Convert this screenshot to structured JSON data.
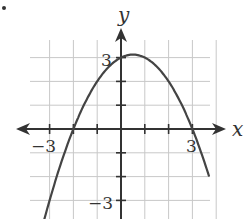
{
  "chart_data": {
    "type": "line",
    "title": "",
    "xlabel": "x",
    "ylabel": "y",
    "xlim": [
      -3.5,
      3.8
    ],
    "ylim": [
      -3.9,
      4.1
    ],
    "grid": true,
    "x_tick_labels": [
      {
        "value": -3,
        "label": "−3"
      },
      {
        "value": 3,
        "label": "3"
      }
    ],
    "y_tick_labels": [
      {
        "value": 3,
        "label": "3"
      },
      {
        "value": -3,
        "label": "−3"
      }
    ],
    "series": [
      {
        "name": "parabola",
        "function": "y = -0.5(x+2)(x-3)",
        "x": [
          -3.25,
          -3,
          -2.5,
          -2,
          -1.5,
          -1,
          -0.5,
          0,
          0.5,
          1,
          1.5,
          2,
          2.5,
          3,
          3.5,
          3.7
        ],
        "y": [
          -3.94,
          -3,
          -1.38,
          0,
          1.31,
          2,
          2.63,
          3,
          3.13,
          3,
          2.63,
          2,
          1.13,
          0,
          -1.38,
          -1.94
        ]
      }
    ],
    "key_points": {
      "x_intercepts": [
        -2,
        3
      ],
      "y_intercept": 3,
      "vertex": [
        0.5,
        3.125
      ]
    }
  },
  "labels": {
    "x_axis": "x",
    "y_axis": "y",
    "x_neg3": "−3",
    "x_pos3": "3",
    "y_pos3": "3",
    "y_neg3": "−3"
  }
}
